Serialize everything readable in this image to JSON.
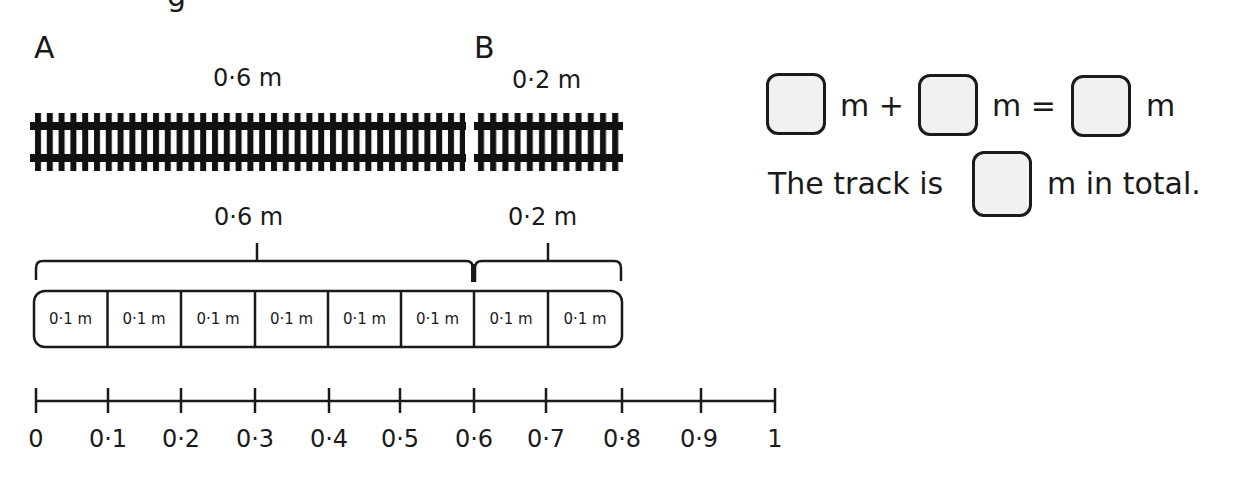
{
  "header": {
    "cut_text": "g"
  },
  "tracks": {
    "a": {
      "letter": "A",
      "length_label": "0·6 m"
    },
    "b": {
      "letter": "B",
      "length_label": "0·2 m"
    }
  },
  "bar_model": {
    "brace_labels": [
      "0·6 m",
      "0·2 m"
    ],
    "cells": [
      "0·1 m",
      "0·1 m",
      "0·1 m",
      "0·1 m",
      "0·1 m",
      "0·1 m",
      "0·1 m",
      "0·1 m"
    ]
  },
  "number_line": {
    "ticks": [
      "0",
      "0·1",
      "0·2",
      "0·3",
      "0·4",
      "0·5",
      "0·6",
      "0·7",
      "0·8",
      "0·9",
      "1"
    ]
  },
  "equation": {
    "unit1": "m +",
    "unit2": "m =",
    "unit3": "m",
    "sentence_prefix": "The track is",
    "sentence_suffix": "m in total."
  },
  "colors": {
    "ink": "#1a1a1a",
    "answer_box_fill": "#f1f1f1"
  }
}
